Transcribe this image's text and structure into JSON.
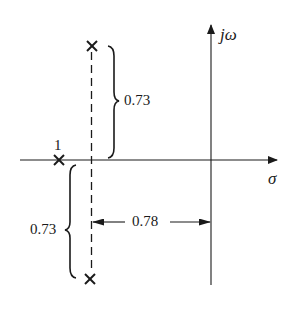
{
  "diagram": {
    "type": "s-plane pole plot",
    "colors": {
      "ink": "#1a1a1a",
      "background": "#ffffff"
    },
    "axes": {
      "real_axis_label": "σ",
      "imag_axis_label": "jω"
    },
    "poles": [
      {
        "id": "pole-real",
        "label": "1",
        "position": "on real axis"
      },
      {
        "id": "pole-upper",
        "label": "",
        "position": "upper complex"
      },
      {
        "id": "pole-lower",
        "label": "",
        "position": "lower complex"
      }
    ],
    "dimensions": {
      "upper_imag_distance": "0.73",
      "lower_imag_distance": "0.73",
      "real_distance": "0.78"
    },
    "labels": {
      "pole_multiplicity": "1",
      "upper_brace_value": "0.73",
      "lower_brace_value": "0.73",
      "horizontal_dimension_value": "0.78",
      "sigma": "σ",
      "j_omega_j": "j",
      "j_omega_omega": "ω"
    }
  }
}
